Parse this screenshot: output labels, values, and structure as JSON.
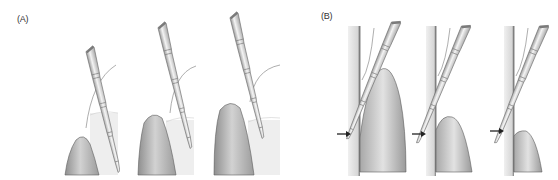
{
  "figure": {
    "groups": [
      {
        "label": "(A)",
        "description": "Periodontal probe inserted into gingival sulcus at three progressively deeper positions",
        "panels": [
          {
            "id": "A1",
            "probe_depth_marks": 4
          },
          {
            "id": "A2",
            "probe_depth_marks": 4
          },
          {
            "id": "A3",
            "probe_depth_marks": 4
          }
        ]
      },
      {
        "label": "(B)",
        "description": "Probe alongside tooth surface with arrows marking the reference level; gingiva height decreasing across panels",
        "panels": [
          {
            "id": "B1",
            "arrow": "right-arrow"
          },
          {
            "id": "B2",
            "arrow": "right-arrow"
          },
          {
            "id": "B3",
            "arrow": "right-arrow"
          }
        ]
      }
    ],
    "colors": {
      "probe": "#d9d9d9",
      "probe_outline": "#7a7a7a",
      "gingiva_dark": "#9a9a9a",
      "gingiva_light": "#e6e6e6",
      "tooth": "#eeeeee",
      "arrow": "#222222"
    }
  }
}
